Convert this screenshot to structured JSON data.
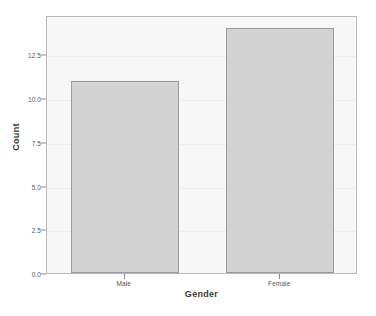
{
  "chart_data": {
    "type": "bar",
    "title": "",
    "subtitle": "",
    "xlabel": "Gender",
    "ylabel": "Count",
    "categories": [
      "Male",
      "Female"
    ],
    "values": [
      11,
      14
    ],
    "series": [
      {
        "name": "Count",
        "values": [
          11,
          14
        ]
      }
    ],
    "ylim": [
      0,
      14.75
    ],
    "yticks": [
      0.0,
      2.5,
      5.0,
      7.5,
      10.0,
      12.5
    ],
    "ytick_labels": [
      "0.0",
      "2.5",
      "5.0",
      "7.5",
      "10.0",
      "12.5"
    ],
    "grid": true,
    "legend": false,
    "legend_position": "none",
    "annotations": [],
    "colors": {
      "bar_fill": "#d3d3d3",
      "bar_border": "#9a9a9a",
      "plot_background": "#f7f7f7",
      "frame_border": "#b9b9b9",
      "page_background": "#ffffff",
      "tick_label": "#555555",
      "axis_title": "#3a3a3a",
      "gridline": "#ececec"
    }
  }
}
